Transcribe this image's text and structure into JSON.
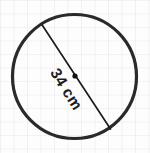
{
  "figure": {
    "kind": "circle-with-diameter",
    "caption_label": "34 cm",
    "center_dot_name": "circle-center-point",
    "background_color": "#fdfdfd",
    "grid_color": "#e9e9ec",
    "grid_spacing_px": 13.5,
    "ink_color": "#2a2a2a",
    "line_color": "#1d1d1d"
  },
  "chart_data": {
    "type": "diagram",
    "title": "",
    "shape": "circle",
    "annotations": [
      {
        "name": "diameter-label",
        "text": "34 cm",
        "value": 34,
        "unit": "cm",
        "measures": "diameter",
        "rotation_deg": 58
      }
    ],
    "geometry": {
      "circle": {
        "cx": 74.5,
        "cy": 76.5,
        "r": 62.0,
        "stroke_width": 3.2
      },
      "diameter_segment": {
        "x1": 41.5,
        "y1": 24.0,
        "x2": 110.5,
        "y2": 129.0,
        "stroke_width": 1.7
      },
      "center_point": {
        "cx": 75.0,
        "cy": 76.0,
        "r": 2.6
      }
    }
  }
}
